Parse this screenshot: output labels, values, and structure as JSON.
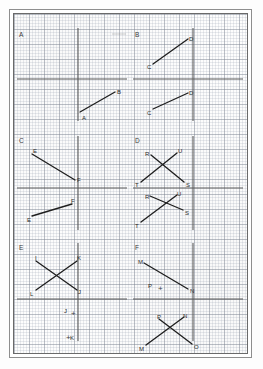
{
  "worksheet": {
    "title": "Graph paper worksheet with six coordinate panels",
    "paper_type": "graph-paper",
    "grid": {
      "minor_spacing_px": 3,
      "major_spacing_px": 15,
      "minor_color": "#96a0af",
      "major_color": "#78808c"
    },
    "colors": {
      "axis": "#585858",
      "segment": "#1f1f1f",
      "border": "#6a6a6a",
      "outer_border": "#8e8e8e",
      "paper": "#fdfdfd"
    }
  },
  "panels": [
    {
      "letter": "A",
      "letter_pos": {
        "x": 5,
        "y": 18
      },
      "axes": {
        "vertical": {
          "x": 64,
          "y1": 14,
          "y2": 107
        },
        "horizontal": {
          "y": 65,
          "x1": 3,
          "x2": 113
        }
      },
      "segments": [
        {
          "name": "AB",
          "from": {
            "label": "A",
            "x": 66,
            "y": 98,
            "label_x": 68,
            "label_y": 101
          },
          "to": {
            "label": "B",
            "x": 101,
            "y": 78,
            "label_x": 103,
            "label_y": 75
          }
        }
      ],
      "marks": []
    },
    {
      "letter": "B",
      "letter_pos": {
        "x": 121,
        "y": 18
      },
      "axes": {
        "vertical": {
          "x": 179,
          "y1": 14,
          "y2": 107
        },
        "horizontal": {
          "y": 65,
          "x1": 119,
          "x2": 229
        }
      },
      "segments": [
        {
          "name": "CD-upper",
          "from": {
            "label": "C",
            "x": 139,
            "y": 50,
            "label_x": 133,
            "label_y": 50
          },
          "to": {
            "label": "D",
            "x": 174,
            "y": 25,
            "label_x": 175,
            "label_y": 22
          }
        },
        {
          "name": "CD-lower",
          "from": {
            "label": "C",
            "x": 139,
            "y": 95,
            "label_x": 133,
            "label_y": 96
          },
          "to": {
            "label": "D",
            "x": 174,
            "y": 79,
            "label_x": 175,
            "label_y": 76
          }
        }
      ],
      "marks": []
    },
    {
      "letter": "C",
      "letter_pos": {
        "x": 5,
        "y": 124
      },
      "axes": {
        "vertical": {
          "x": 64,
          "y1": 122,
          "y2": 216
        },
        "horizontal": {
          "y": 174,
          "x1": 3,
          "x2": 113
        }
      },
      "segments": [
        {
          "name": "EF-upper",
          "from": {
            "label": "E",
            "x": 18,
            "y": 140,
            "label_x": 19,
            "label_y": 134
          },
          "to": {
            "label": "F",
            "x": 61,
            "y": 166,
            "label_x": 63,
            "label_y": 163
          }
        },
        {
          "name": "EF-lower",
          "from": {
            "label": "E",
            "x": 18,
            "y": 202,
            "label_x": 13,
            "label_y": 203
          },
          "to": {
            "label": "F",
            "x": 58,
            "y": 190,
            "label_x": 57,
            "label_y": 184
          }
        }
      ],
      "marks": []
    },
    {
      "letter": "D",
      "letter_pos": {
        "x": 121,
        "y": 124
      },
      "axes": {
        "vertical": {
          "x": 179,
          "y1": 122,
          "y2": 216
        },
        "horizontal": {
          "y": 174,
          "x1": 119,
          "x2": 229
        }
      },
      "segments": [
        {
          "name": "RS-upper",
          "from": {
            "label": "R",
            "x": 137,
            "y": 141,
            "label_x": 131,
            "label_y": 137
          },
          "to": {
            "label": "S",
            "x": 170,
            "y": 168,
            "label_x": 172,
            "label_y": 168
          }
        },
        {
          "name": "TU-upper",
          "from": {
            "label": "T",
            "x": 127,
            "y": 168,
            "label_x": 121,
            "label_y": 168
          },
          "to": {
            "label": "U",
            "x": 163,
            "y": 139,
            "label_x": 164,
            "label_y": 134
          }
        },
        {
          "name": "RS-lower",
          "from": {
            "label": "R",
            "x": 136,
            "y": 182,
            "label_x": 131,
            "label_y": 180
          },
          "to": {
            "label": "S",
            "x": 169,
            "y": 196,
            "label_x": 171,
            "label_y": 196
          }
        },
        {
          "name": "TU-lower",
          "from": {
            "label": "T",
            "x": 127,
            "y": 208,
            "label_x": 121,
            "label_y": 209
          },
          "to": {
            "label": "U",
            "x": 163,
            "y": 181,
            "label_x": 163,
            "label_y": 177
          }
        }
      ],
      "marks": []
    },
    {
      "letter": "E",
      "letter_pos": {
        "x": 5,
        "y": 231
      },
      "axes": {
        "vertical": {
          "x": 64,
          "y1": 229,
          "y2": 327
        },
        "horizontal": {
          "y": 285,
          "x1": 3,
          "x2": 113
        }
      },
      "segments": [
        {
          "name": "IJ",
          "from": {
            "label": "I",
            "x": 22,
            "y": 247,
            "label_x": 21,
            "label_y": 241
          },
          "to": {
            "label": "J",
            "x": 63,
            "y": 276,
            "label_x": 64,
            "label_y": 275
          }
        },
        {
          "name": "KL",
          "from": {
            "label": "L",
            "x": 22,
            "y": 276,
            "label_x": 16,
            "label_y": 277
          },
          "to": {
            "label": "K",
            "x": 63,
            "y": 247,
            "label_x": 63,
            "label_y": 241
          }
        }
      ],
      "marks": [
        {
          "label": "J",
          "x": 57,
          "y": 296,
          "label_x": 50,
          "label_y": 294
        },
        {
          "label": "K",
          "x": 52,
          "y": 320,
          "label_x": 56,
          "label_y": 321
        }
      ]
    },
    {
      "letter": "F",
      "letter_pos": {
        "x": 121,
        "y": 231
      },
      "axes": {
        "vertical": {
          "x": 179,
          "y1": 229,
          "y2": 327
        },
        "horizontal": {
          "y": 285,
          "x1": 119,
          "x2": 229
        }
      },
      "segments": [
        {
          "name": "MN-upper",
          "from": {
            "label": "M",
            "x": 130,
            "y": 249,
            "label_x": 124,
            "label_y": 245
          },
          "to": {
            "label": "N",
            "x": 174,
            "y": 275,
            "label_x": 176,
            "label_y": 274
          }
        },
        {
          "name": "PO-lower",
          "from": {
            "label": "P",
            "x": 145,
            "y": 305,
            "label_x": 143,
            "label_y": 300
          },
          "to": {
            "label": "O",
            "x": 178,
            "y": 330,
            "label_x": 180,
            "label_y": 330
          }
        },
        {
          "name": "MN-lower",
          "from": {
            "label": "M",
            "x": 132,
            "y": 331,
            "label_x": 125,
            "label_y": 332
          },
          "to": {
            "label": "N",
            "x": 170,
            "y": 303,
            "label_x": 169,
            "label_y": 299
          }
        }
      ],
      "marks": [
        {
          "label": "P",
          "x": 144,
          "y": 271,
          "label_x": 134,
          "label_y": 269
        }
      ]
    }
  ],
  "artifacts": {
    "top_smudge": {
      "x1": 98,
      "y1": 20,
      "x2": 112,
      "y2": 20
    }
  }
}
